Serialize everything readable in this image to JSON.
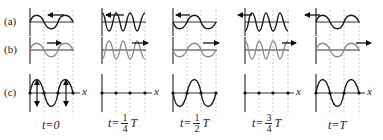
{
  "figure": {
    "row_labels": [
      "(a)",
      "(b)",
      "(c)"
    ],
    "axis_label": "x",
    "panels": [
      {
        "id": "t0",
        "time_label": "t=0",
        "time_prefix": "t=0",
        "num": "",
        "den": "",
        "suffix": "",
        "a_arrow": "left",
        "b_arrow": "right"
      },
      {
        "id": "t1",
        "time_prefix": "t=",
        "num": "1",
        "den": "4",
        "suffix": "T",
        "a_arrow": "left",
        "b_arrow": "right"
      },
      {
        "id": "t2",
        "time_prefix": "t=",
        "num": "1",
        "den": "2",
        "suffix": "T",
        "a_arrow": "left",
        "b_arrow": "right"
      },
      {
        "id": "t3",
        "time_prefix": "t=",
        "num": "3",
        "den": "4",
        "suffix": "T",
        "a_arrow": "left",
        "b_arrow": "right"
      },
      {
        "id": "t4",
        "time_prefix": "t=T",
        "num": "",
        "den": "",
        "suffix": "",
        "a_arrow": "left",
        "b_arrow": "right"
      }
    ],
    "colors": {
      "wave_a": "#1a1a1a",
      "wave_b": "#8a8a8a",
      "wave_c": "#1a1a1a",
      "axis": "#333333",
      "dashed_guides": "#bbbbbb"
    }
  }
}
